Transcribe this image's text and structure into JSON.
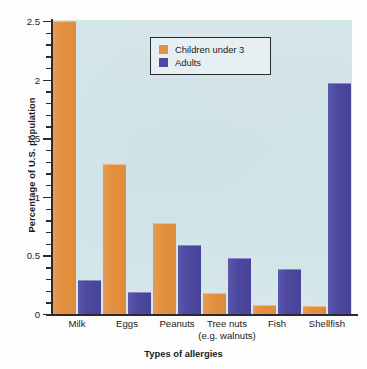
{
  "chart_data": {
    "type": "bar",
    "title": "",
    "xlabel": "Types of allergies",
    "ylabel": "Percentage of U.S. population",
    "categories": [
      "Milk",
      "Eggs",
      "Peanuts",
      "Tree nuts",
      "Fish",
      "Shellfish"
    ],
    "category_sublabels": [
      "",
      "",
      "",
      "(e.g. walnuts)",
      "",
      ""
    ],
    "series": [
      {
        "name": "Children under 3",
        "color": "#e3913f",
        "values": [
          2.5,
          1.28,
          0.78,
          0.18,
          0.08,
          0.07
        ]
      },
      {
        "name": "Adults",
        "color": "#4d49a0",
        "values": [
          0.29,
          0.19,
          0.59,
          0.48,
          0.38,
          1.97
        ]
      }
    ],
    "ylim": [
      0,
      2.6
    ],
    "yticks": [
      0,
      0.5,
      1,
      1.5,
      2,
      2.5
    ],
    "ytick_labels": [
      "0",
      "0.5",
      "1",
      "1.5",
      "2",
      "2.5"
    ],
    "minor_tick_step": 0.1,
    "grid": false,
    "legend_position": "top-center",
    "plot_background": "#d3e4e9"
  },
  "legend": {
    "items": [
      {
        "label": "Children under 3",
        "swatch": "orange"
      },
      {
        "label": "Adults",
        "swatch": "blue"
      }
    ]
  }
}
